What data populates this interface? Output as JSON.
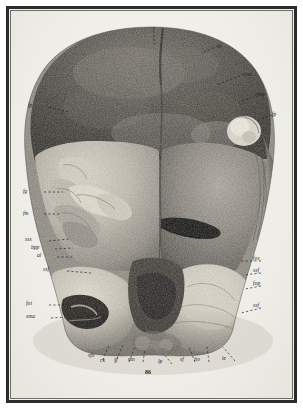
{
  "plate": {
    "kind": "anatomical-halftone-plate",
    "subject": "skull-posterior-basal-view",
    "figure_number": "86",
    "background_color": "#f2f1ed",
    "frame_color": "#2b2b2b",
    "ink_color": "#23211e"
  },
  "labels": [
    {
      "id": "t",
      "text": "t",
      "x": 153,
      "y": 26,
      "lead": "down"
    },
    {
      "id": "ls",
      "text": "ls",
      "x": 218,
      "y": 44,
      "lead": "left"
    },
    {
      "id": "coe",
      "text": "coe",
      "x": 244,
      "y": 72,
      "lead": "left"
    },
    {
      "id": "fmg",
      "text": "fmg",
      "x": 256,
      "y": 92,
      "lead": "left"
    },
    {
      "id": "fp-r",
      "text": "fp",
      "x": 272,
      "y": 112,
      "lead": "left"
    },
    {
      "id": "fp-l",
      "text": "fp",
      "x": 28,
      "y": 103,
      "lead": "right"
    },
    {
      "id": "fg",
      "text": "fg",
      "x": 23,
      "y": 189,
      "lead": "right"
    },
    {
      "id": "fm",
      "text": "fm",
      "x": 23,
      "y": 211,
      "lead": "right"
    },
    {
      "id": "sss",
      "text": "sss",
      "x": 25,
      "y": 237,
      "lead": "right"
    },
    {
      "id": "bpp",
      "text": "bpp",
      "x": 31,
      "y": 245,
      "lead": "right"
    },
    {
      "id": "al",
      "text": "al",
      "x": 37,
      "y": 253,
      "lead": "right"
    },
    {
      "id": "ssf-l",
      "text": "ssf",
      "x": 43,
      "y": 267,
      "lead": "right"
    },
    {
      "id": "foi",
      "text": "foi",
      "x": 26,
      "y": 301,
      "lead": "right"
    },
    {
      "id": "sma",
      "text": "sma",
      "x": 26,
      "y": 314,
      "lead": "right"
    },
    {
      "id": "fos",
      "text": "fos",
      "x": 253,
      "y": 256,
      "lead": "left"
    },
    {
      "id": "ssf-r",
      "text": "ssf",
      "x": 253,
      "y": 268,
      "lead": "left"
    },
    {
      "id": "fop",
      "text": "fop",
      "x": 253,
      "y": 281,
      "lead": "left"
    },
    {
      "id": "ssf-r2",
      "text": "ssf",
      "x": 253,
      "y": 303,
      "lead": "left"
    },
    {
      "id": "sfo",
      "text": "sfo",
      "x": 88,
      "y": 353,
      "lead": "up"
    },
    {
      "id": "ck",
      "text": "ck",
      "x": 100,
      "y": 358,
      "lead": "up"
    },
    {
      "id": "sf-l",
      "text": "sf",
      "x": 114,
      "y": 357,
      "lead": "up"
    },
    {
      "id": "mn",
      "text": "mn",
      "x": 128,
      "y": 357,
      "lead": "up"
    },
    {
      "id": "lp",
      "text": "lp",
      "x": 158,
      "y": 359,
      "lead": "up"
    },
    {
      "id": "sf-r",
      "text": "sf",
      "x": 180,
      "y": 357,
      "lead": "up"
    },
    {
      "id": "ito",
      "text": "ito",
      "x": 194,
      "y": 357,
      "lead": "up"
    },
    {
      "id": "ie",
      "text": "ie",
      "x": 222,
      "y": 356,
      "lead": "up"
    }
  ],
  "inscription": {
    "text": "ill",
    "x": 62,
    "y": 52
  }
}
